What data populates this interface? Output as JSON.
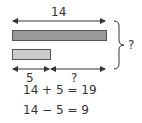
{
  "diagram": {
    "total_label": "14",
    "bar_long": {
      "value": "14",
      "color": "#999999"
    },
    "bar_short": {
      "value": "5",
      "color": "#cccccc"
    },
    "part_known_label": "5",
    "part_unknown_label": "?",
    "sum_unknown_label": "?",
    "equations": [
      "14 + 5 = 19",
      "14 − 5 = 9"
    ]
  },
  "colors": {
    "stroke": "#333333",
    "bar_long": "#999999",
    "bar_short": "#cccccc"
  }
}
